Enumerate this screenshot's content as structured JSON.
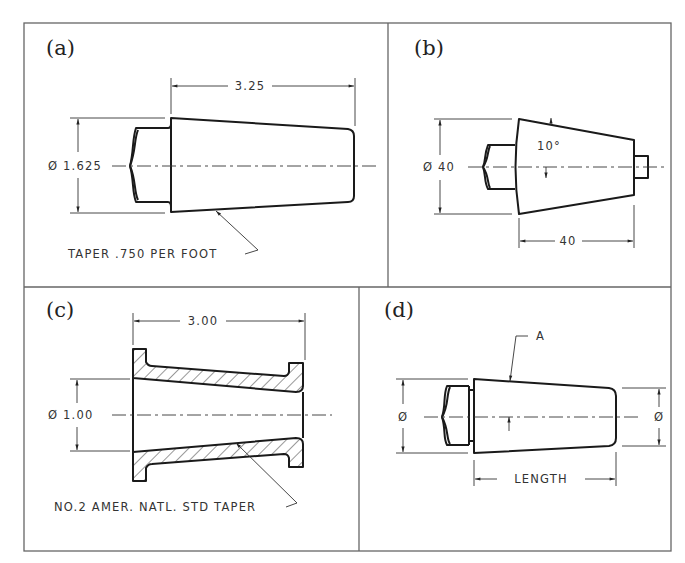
{
  "figure": {
    "panels": [
      {
        "id": "a",
        "label": "(a)",
        "dimensions": {
          "length": "3.25",
          "diameter": "Ø 1.625"
        },
        "note": "TAPER .750 PER FOOT"
      },
      {
        "id": "b",
        "label": "(b)",
        "dimensions": {
          "diameter": "Ø 40",
          "length": "40",
          "angle": "10°"
        }
      },
      {
        "id": "c",
        "label": "(c)",
        "dimensions": {
          "length": "3.00",
          "diameter": "Ø 1.00"
        },
        "note": "NO.2 AMER. NATL. STD TAPER"
      },
      {
        "id": "d",
        "label": "(d)",
        "dimensions": {
          "left_diameter": "Ø",
          "right_diameter": "Ø",
          "length": "LENGTH"
        },
        "callout": "A"
      }
    ]
  }
}
